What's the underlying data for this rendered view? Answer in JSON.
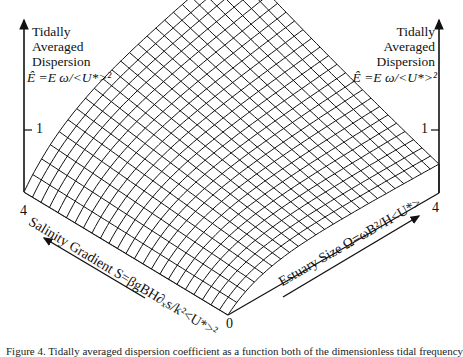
{
  "figure": {
    "left_axis": {
      "title_lines": [
        "Tidally",
        "Averaged",
        "Dispersion"
      ],
      "formula": "Ê =E ω/<U*>²",
      "tick_label": "1"
    },
    "right_axis": {
      "title_lines": [
        "Tidally",
        "Averaged",
        "Dispersion"
      ],
      "formula": "Ê =E ω/<U*>²",
      "tick_label": "1"
    },
    "salinity_axis": {
      "label": "Salinity Gradient S=βgBH∂ₓs/k²<U*>²",
      "end_label": "4"
    },
    "estuary_axis": {
      "label": "Estuary Size  Ω=ωB²/H<U*>",
      "end_label": "4"
    },
    "origin_label": "0",
    "caption": "Figure 4. Tidally averaged dispersion coefficient as a function both of the dimensionless tidal frequency"
  },
  "chart_data": {
    "type": "surface",
    "title": "Tidally Averaged Dispersion",
    "zlabel": "Tidally Averaged Dispersion Ê = E ω/<U*>²",
    "xlabel": "Salinity Gradient S=βgBH∂ₓs/k²<U*>²",
    "ylabel": "Estuary Size Ω=ωB²/H<U*>",
    "xlim": [
      0,
      4
    ],
    "ylim": [
      0,
      4
    ],
    "zticks": [
      1
    ],
    "x_ticks": [
      "0",
      "4"
    ],
    "y_ticks": [
      "0",
      "4"
    ],
    "grid": "wireframe mesh ~24x24",
    "sample_points": [
      {
        "S": 0,
        "Omega": 0,
        "E": 0.0
      },
      {
        "S": 4,
        "Omega": 0,
        "E": 0.0
      },
      {
        "S": 0,
        "Omega": 4,
        "E": 0.5
      },
      {
        "S": 4,
        "Omega": 4,
        "E": 1.8
      },
      {
        "S": 0,
        "Omega": 1,
        "E": 0.45
      },
      {
        "S": 2,
        "Omega": 2,
        "E": 0.9
      }
    ]
  },
  "geometry": {
    "front": [
      228,
      315
    ],
    "left": [
      24,
      192
    ],
    "right": [
      439,
      193
    ],
    "height_px_per_unit": 62,
    "mesh_n": 24,
    "line_color": "#111111"
  }
}
